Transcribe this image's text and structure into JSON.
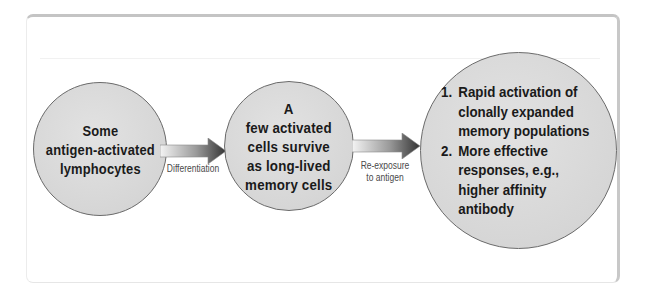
{
  "diagram": {
    "type": "flow",
    "nodes": [
      {
        "id": "activated",
        "lines": [
          "Some",
          "antigen-activated",
          "lymphocytes"
        ]
      },
      {
        "id": "memory",
        "lines": [
          "A",
          "few activated",
          "cells survive",
          "as long-lived",
          "memory cells"
        ]
      },
      {
        "id": "outcomes",
        "items": [
          {
            "number": "1.",
            "lines": [
              "Rapid activation of",
              "clonally expanded",
              "memory populations"
            ]
          },
          {
            "number": "2.",
            "lines": [
              "More effective",
              "responses, e.g.,",
              "higher affinity",
              "antibody"
            ]
          }
        ]
      }
    ],
    "edges": [
      {
        "from": "activated",
        "to": "memory",
        "label_lines": [
          "Differentiation"
        ]
      },
      {
        "from": "memory",
        "to": "outcomes",
        "label_lines": [
          "Re-exposure",
          "to antigen"
        ]
      }
    ],
    "colors": {
      "circle_fill": "#d9d9d9",
      "circle_stroke": "#6a6a6a",
      "arrow_dark": "#3a3a3a",
      "arrow_light": "#f2f2f2",
      "text": "#1a1a1a",
      "label_text": "#4a4a4a",
      "frame_border": "#c4c4c4"
    }
  }
}
